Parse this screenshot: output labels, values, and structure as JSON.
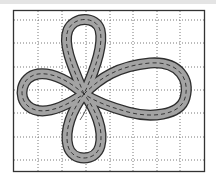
{
  "diagram": {
    "title": "",
    "frame": {
      "x": 13,
      "y": 10,
      "width": 192,
      "height": 162
    },
    "grid": {
      "vertical_lines_x": [
        38,
        62,
        86,
        110,
        133,
        157,
        180
      ],
      "horizontal_lines_y": [
        20,
        43,
        67,
        90,
        113,
        137,
        160
      ],
      "style": "dotted"
    },
    "track": {
      "loops": [
        "top",
        "right",
        "left",
        "bottom"
      ],
      "crossing_point": {
        "x": 84,
        "y": 94
      },
      "road_color": "#a3a3a3",
      "edge_color": "#2e2e2e",
      "centerline_color": "#2a2a2a",
      "centerline_style": "dashed"
    },
    "colors": {
      "background": "#ffffff",
      "frame": "#333333",
      "grid": "#666666",
      "top_band": "#e4e4e4"
    }
  }
}
